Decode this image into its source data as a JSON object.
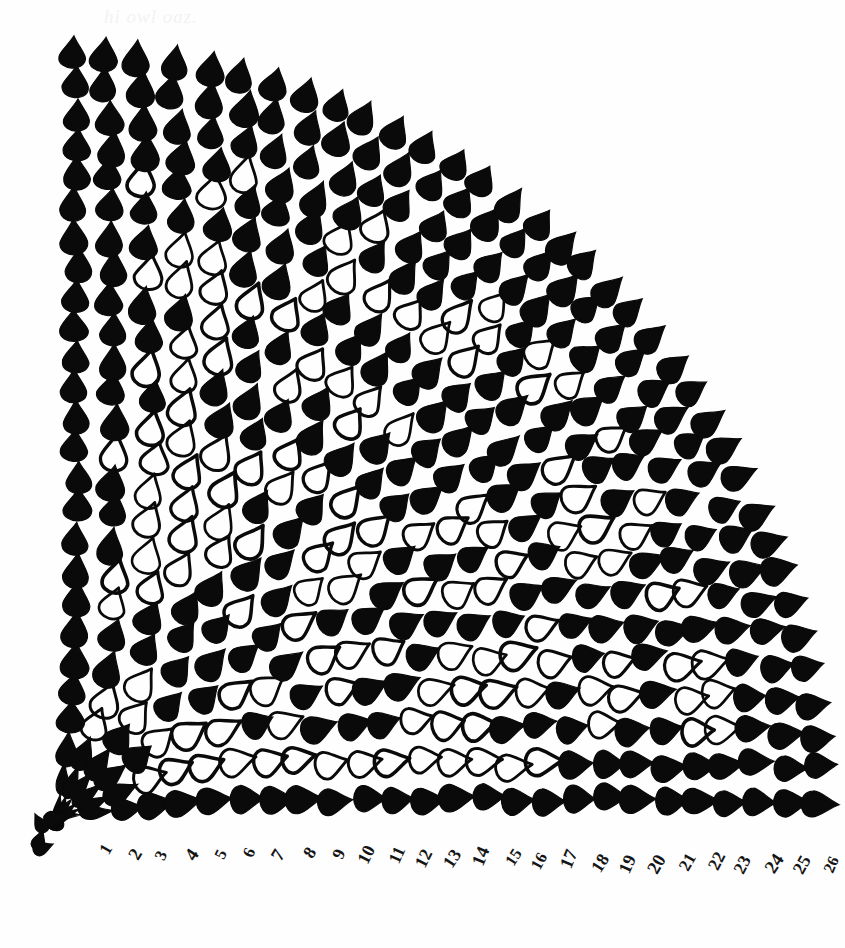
{
  "document": {
    "kind": "hand-drawn crochet stitch chart",
    "title": "Quarter-circle fan shawl stitch chart",
    "background_color": "#ffffff",
    "ink_color": "#0a0a0a",
    "ghost_text": {
      "line1": "hi owl oaz.",
      "line2": "..."
    }
  },
  "chart_data": {
    "type": "diagram",
    "subtype": "radial stitch chart",
    "center": {
      "x": 57,
      "y": 818
    },
    "inner_radius": 26,
    "outer_radius": 782,
    "angle_start_deg": -90,
    "angle_end_deg": 0,
    "rounds": 26,
    "round_labels": [
      "1",
      "2",
      "3",
      "4",
      "5",
      "6",
      "7",
      "8",
      "9",
      "10",
      "11",
      "12",
      "13",
      "14",
      "15",
      "16",
      "17",
      "18",
      "19",
      "20",
      "21",
      "22",
      "23",
      "24",
      "25",
      "26"
    ],
    "label_position": "along bottom edge, rotated, one per round",
    "label_rotation_deg": -62,
    "symbols": {
      "filled": {
        "name": "solid petal",
        "fill": "#0a0a0a",
        "meaning": "filled stitch"
      },
      "open": {
        "name": "open petal",
        "fill": "none",
        "stroke": "#0a0a0a",
        "meaning": "open / chain stitch"
      },
      "center": {
        "name": "center rosette",
        "petals": 9,
        "fill": "#0a0a0a"
      }
    },
    "grid": {
      "rings": 26,
      "stitches_per_ring_formula": "grows with radius, from 6 at ring 1 to about 42 at ring 26",
      "note": "Each ring doubles in stitch count at several expansion rounds producing the fan flare."
    },
    "legend_present": false,
    "axes_present": false
  },
  "rosette": {
    "petal_count": 9,
    "radius": 30
  },
  "numbers": [
    {
      "label": "1"
    },
    {
      "label": "2"
    },
    {
      "label": "3"
    },
    {
      "label": "4"
    },
    {
      "label": "5"
    },
    {
      "label": "6"
    },
    {
      "label": "7"
    },
    {
      "label": "8"
    },
    {
      "label": "9"
    },
    {
      "label": "10"
    },
    {
      "label": "11"
    },
    {
      "label": "12"
    },
    {
      "label": "13"
    },
    {
      "label": "14"
    },
    {
      "label": "15"
    },
    {
      "label": "16"
    },
    {
      "label": "17"
    },
    {
      "label": "18"
    },
    {
      "label": "19"
    },
    {
      "label": "20"
    },
    {
      "label": "21"
    },
    {
      "label": "22"
    },
    {
      "label": "23"
    },
    {
      "label": "24"
    },
    {
      "label": "25"
    },
    {
      "label": "26"
    }
  ]
}
